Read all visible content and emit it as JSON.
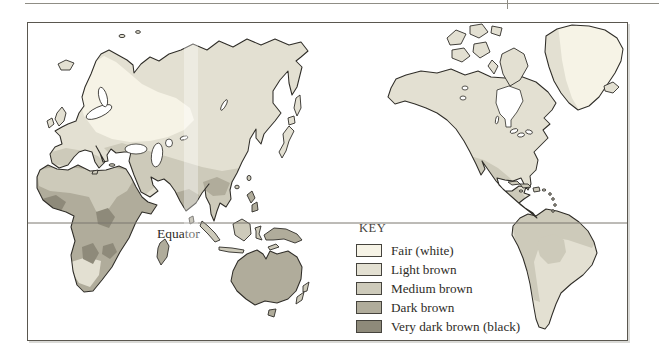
{
  "figure": {
    "equator_label": "Equator",
    "key": {
      "title": "KEY",
      "items": [
        {
          "id": "fair",
          "label": "Fair (white)",
          "color": "#f6f3e6"
        },
        {
          "id": "light",
          "label": "Light brown",
          "color": "#e3e0d2"
        },
        {
          "id": "medium",
          "label": "Medium brown",
          "color": "#cdcaba"
        },
        {
          "id": "dark",
          "label": "Dark brown",
          "color": "#b0ac9b"
        },
        {
          "id": "very_dark",
          "label": "Very dark brown (black)",
          "color": "#8e8a7a"
        }
      ]
    },
    "palette": {
      "coastline": "#2f2d28",
      "frame_border": "#5a574f",
      "equator_line": "#7a776e",
      "water": "#ffffff",
      "text": "#2e2c27",
      "scan_rule": "#8f8d85",
      "scan_shadow": "#d3d1c9"
    },
    "region_tones": {
      "scandinavia_baltic_nw_russia": "fair",
      "greenland_interior": "fair",
      "europe_russia_siberia_china_north_america": "light",
      "japan_uk_iceland_south_africa_cape": "light",
      "southern_and_eastern_south_america": "light",
      "north_africa_middle_east_india_north": "medium",
      "southeast_asia_indonesia_south_china": "medium",
      "mexico_southwest_us_central_america": "medium",
      "northern_andean_south_america_caribbean": "medium",
      "mediterranean_southern_europe": "medium",
      "sub_saharan_africa_madagascar": "dark",
      "south_india_new_guinea_australia_philippines": "dark",
      "west_and_central_africa_patches": "very_dark"
    }
  }
}
